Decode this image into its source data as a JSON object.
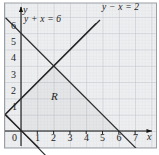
{
  "figure": {
    "title": "",
    "region_label": "R",
    "axis_x_name": "x",
    "axis_y_name": "y"
  },
  "chart_data": {
    "type": "line",
    "title": "",
    "xlabel": "x",
    "ylabel": "y",
    "xlim": [
      -1,
      7.6
    ],
    "ylim": [
      -1.1,
      6.8
    ],
    "grid": true,
    "minor_grid": true,
    "legend": "inline-annotations",
    "xticks": [
      0,
      1,
      2,
      3,
      4,
      5,
      6,
      7
    ],
    "xtick_labels": [
      "0",
      "1",
      "2",
      "3",
      "4",
      "5",
      "6",
      "7"
    ],
    "yticks": [
      1,
      2,
      3,
      4,
      5,
      6
    ],
    "ytick_labels": [
      "1",
      "2",
      "3",
      "4",
      "5",
      "6"
    ],
    "series": [
      {
        "name": "y + x = 6",
        "label": "y + x = 6",
        "slope": -1,
        "intercept": 6,
        "x": [
          -0.95,
          7.45
        ],
        "y": [
          6.95,
          -1.45
        ],
        "x_intercept": 6,
        "y_intercept": 6
      },
      {
        "name": "y - x = 2",
        "label": "y − x = 2",
        "slope": 1,
        "intercept": 2,
        "x": [
          -0.95,
          4.6
        ],
        "y": [
          1.05,
          6.6
        ],
        "x_intercept": -2,
        "y_intercept": 2
      }
    ],
    "annotations": [
      {
        "text": "y + x = 6",
        "x": 0.55,
        "y": 6.05
      },
      {
        "text": "y − x = 2",
        "x": 5.0,
        "y": 6.6
      },
      {
        "text": "R",
        "x": 2.0,
        "y": 2.15
      }
    ],
    "intersection": {
      "x": 2,
      "y": 4
    },
    "shaded_region": {
      "label": "R",
      "vertices": [
        [
          0,
          2
        ],
        [
          2,
          4
        ],
        [
          6,
          0
        ],
        [
          0,
          0
        ]
      ],
      "description": "region bounded by y + x = 6, y - x = 2 and the axes"
    }
  },
  "colors": {
    "line": "#2a2a2a",
    "axis": "#111111",
    "grid_major": "#b9bcc4",
    "grid_minor": "#d6d9de",
    "background": "#eeeff1",
    "border": "#9aa0a6",
    "text": "#1d1d1d"
  }
}
